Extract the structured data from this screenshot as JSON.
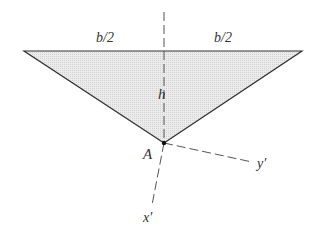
{
  "diagram": {
    "type": "triangle-geometry",
    "labels": {
      "half_base_left": "b/2",
      "half_base_right": "b/2",
      "height": "h",
      "vertex": "A",
      "axis_x_prime": "x′",
      "axis_y_prime": "y′"
    },
    "colors": {
      "fill": "#e2e2e2",
      "stroke": "#333333",
      "dash": "#555555"
    }
  }
}
